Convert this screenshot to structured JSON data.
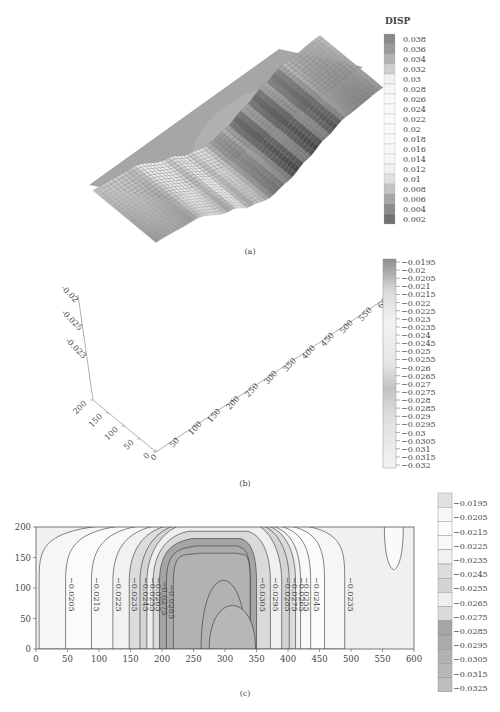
{
  "chart_data": [
    {
      "id": "a",
      "type": "heatmap",
      "caption": "(a)",
      "legend_title": "DISP",
      "legend_ticks": [
        "0.038",
        "0.036",
        "0.034",
        "0.032",
        "0.03",
        "0.028",
        "0.026",
        "0.024",
        "0.022",
        "0.02",
        "0.018",
        "0.016",
        "0.014",
        "0.012",
        "0.01",
        "0.008",
        "0.006",
        "0.004",
        "0.002"
      ],
      "legend_colors": [
        "#8a8a8a",
        "#9a9a9a",
        "#b2b2b2",
        "#cfcfcf",
        "#f1f1f1",
        "#f6f6f6",
        "#f8f8f8",
        "#f9f9f9",
        "#fafafa",
        "#fafafa",
        "#f9f9f9",
        "#f8f8f8",
        "#f6f6f6",
        "#f0f0f0",
        "#e0e0e0",
        "#c4c4c4",
        "#a6a6a6",
        "#8c8c8c",
        "#727272"
      ],
      "legend_placement": "right",
      "description": "3D view of a plate colored by displacement; a darker circular region with a small darker spot near the center-right"
    },
    {
      "id": "b",
      "type": "surface",
      "caption": "(b)",
      "x_ticks": [
        "0",
        "50",
        "100",
        "150",
        "200",
        "250",
        "300",
        "350",
        "400",
        "450",
        "500",
        "550",
        "600"
      ],
      "y_ticks": [
        "0",
        "50",
        "100",
        "150",
        "200"
      ],
      "z_ticks": [
        "-0.02",
        "-0.025",
        "-0.023"
      ],
      "xlim": [
        0,
        600
      ],
      "ylim": [
        0,
        200
      ],
      "colorbar_ticks": [
        "-0.0195",
        "-0.02",
        "-0.0205",
        "-0.021",
        "-0.0215",
        "-0.022",
        "-0.0225",
        "-0.023",
        "-0.0235",
        "-0.024",
        "-0.0245",
        "-0.025",
        "-0.0255",
        "-0.026",
        "-0.0265",
        "-0.027",
        "-0.0275",
        "-0.028",
        "-0.0285",
        "-0.029",
        "-0.0295",
        "-0.03",
        "-0.0305",
        "-0.031",
        "-0.0315",
        "-0.032"
      ],
      "colorbar_range": [
        -0.032,
        -0.0195
      ],
      "profile_x": [
        0,
        100,
        200,
        250,
        300,
        350,
        400,
        450,
        500,
        600
      ],
      "profile_z": [
        -0.0205,
        -0.0215,
        -0.0265,
        -0.0295,
        -0.031,
        -0.0295,
        -0.0265,
        -0.0235,
        -0.021,
        -0.0195
      ]
    },
    {
      "id": "c",
      "type": "contour",
      "caption": "(c)",
      "xlim": [
        0,
        600
      ],
      "ylim": [
        0,
        200
      ],
      "x_ticks": [
        "0",
        "50",
        "100",
        "150",
        "200",
        "250",
        "300",
        "350",
        "400",
        "450",
        "500",
        "550",
        "600"
      ],
      "y_ticks": [
        "0",
        "50",
        "100",
        "150",
        "200"
      ],
      "contour_labels_left": [
        "-0.0205",
        "-0.0215",
        "-0.0225",
        "-0.0235",
        "-0.0245",
        "-0.0255",
        "-0.0265",
        "-0.0275",
        "-0.0285"
      ],
      "contour_labels_right": [
        "-0.0305",
        "-0.0295",
        "-0.0285",
        "-0.0275",
        "-0.0265",
        "-0.0255",
        "-0.0245",
        "-0.0235"
      ],
      "colorbar_ticks": [
        "-0.0195",
        "-0.0205",
        "-0.0215",
        "-0.0225",
        "-0.0235",
        "-0.0245",
        "-0.0255",
        "-0.0265",
        "-0.0275",
        "-0.0285",
        "-0.0295",
        "-0.0305",
        "-0.0315",
        "-0.0325"
      ],
      "colorbar_colors": [
        "#e2e2e2",
        "#f6f6f6",
        "#fbfbfb",
        "#f8f8f8",
        "#f1f1f1",
        "#dcdcdc",
        "#d4d4d4",
        "#efefef",
        "#dadada",
        "#a5a5a5",
        "#ababab",
        "#b2b2b2",
        "#b7b7b7",
        "#bdbdbd"
      ],
      "left_line_x": [
        5,
        47,
        88,
        122,
        148,
        165,
        176,
        186,
        196,
        207,
        218
      ],
      "right_line_x": [
        350,
        372,
        390,
        402,
        412,
        420,
        436,
        458,
        490
      ],
      "center_x": 300,
      "closed_loop": {
        "x_center": 568,
        "y_top": 200,
        "y_bottom": 130
      }
    }
  ]
}
